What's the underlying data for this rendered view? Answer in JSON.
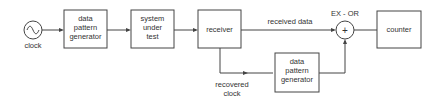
{
  "diagram": {
    "type": "block-diagram",
    "nodes": {
      "clock": {
        "label": "clock",
        "icon": "sine-wave-source-icon"
      },
      "generator1": {
        "lines": [
          "data",
          "pattern",
          "generator"
        ]
      },
      "sut": {
        "lines": [
          "system",
          "under",
          "test"
        ]
      },
      "receiver": {
        "lines": [
          "receiver"
        ]
      },
      "exor": {
        "label": "EX - OR",
        "symbol": "+"
      },
      "counter": {
        "lines": [
          "counter"
        ]
      },
      "generator2": {
        "lines": [
          "data",
          "pattern",
          "generator"
        ]
      }
    },
    "edges": {
      "received_data": "received data",
      "recovered_clock": [
        "recovered",
        "clock"
      ]
    },
    "connections": [
      [
        "clock",
        "generator1"
      ],
      [
        "generator1",
        "sut"
      ],
      [
        "sut",
        "receiver"
      ],
      [
        "receiver",
        "exor"
      ],
      [
        "receiver",
        "generator2"
      ],
      [
        "generator2",
        "exor"
      ],
      [
        "exor",
        "counter"
      ]
    ]
  }
}
